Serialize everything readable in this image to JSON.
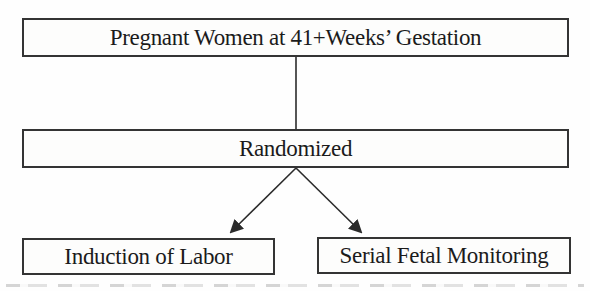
{
  "diagram": {
    "type": "randomized-trial-flowchart",
    "nodes": {
      "population": {
        "label": "Pregnant Women at 41+Weeks’ Gestation"
      },
      "randomized": {
        "label": "Randomized"
      },
      "arm_left": {
        "label": "Induction of Labor"
      },
      "arm_right": {
        "label": "Serial Fetal Monitoring"
      }
    },
    "edges": [
      {
        "from": "population",
        "to": "randomized",
        "style": "plain-line"
      },
      {
        "from": "randomized",
        "to": "arm_left",
        "style": "arrow"
      },
      {
        "from": "randomized",
        "to": "arm_right",
        "style": "arrow"
      }
    ],
    "colors": {
      "background": "#fefefe",
      "box_border": "#343434",
      "text": "#1b1b1b",
      "line": "#2b2b2b"
    }
  }
}
